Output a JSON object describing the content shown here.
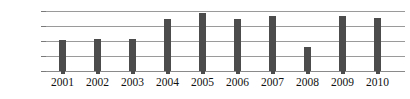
{
  "chart_data": {
    "type": "bar",
    "title": "",
    "xlabel": "",
    "ylabel": "",
    "categories": [
      "2001",
      "2002",
      "2003",
      "2004",
      "2005",
      "2006",
      "2007",
      "2008",
      "2009",
      "2010"
    ],
    "values": [
      2050,
      2150,
      2150,
      3500,
      3900,
      3500,
      3650,
      1620,
      3650,
      3550
    ],
    "ylim": [
      0,
      4000
    ],
    "yticks": [
      0,
      1000,
      2000,
      3000,
      4000
    ],
    "ytick_labels": [
      "0",
      "1000",
      "2000",
      "3000",
      "4000"
    ],
    "grid": true,
    "legend": "none",
    "bar_color": "#4c4c4c",
    "gridline_color": "#9a9a9a",
    "axis_text_color": "#111111",
    "background_color": "#ffffff"
  },
  "axes": {
    "y": {
      "tick_4000": "4000",
      "tick_3000": "3000",
      "tick_2000": "2000",
      "tick_1000": "1000",
      "tick_0": "0"
    },
    "x": {
      "tick_0": "2001",
      "tick_1": "2002",
      "tick_2": "2003",
      "tick_3": "2004",
      "tick_4": "2005",
      "tick_5": "2006",
      "tick_6": "2007",
      "tick_7": "2008",
      "tick_8": "2009",
      "tick_9": "2010"
    }
  }
}
